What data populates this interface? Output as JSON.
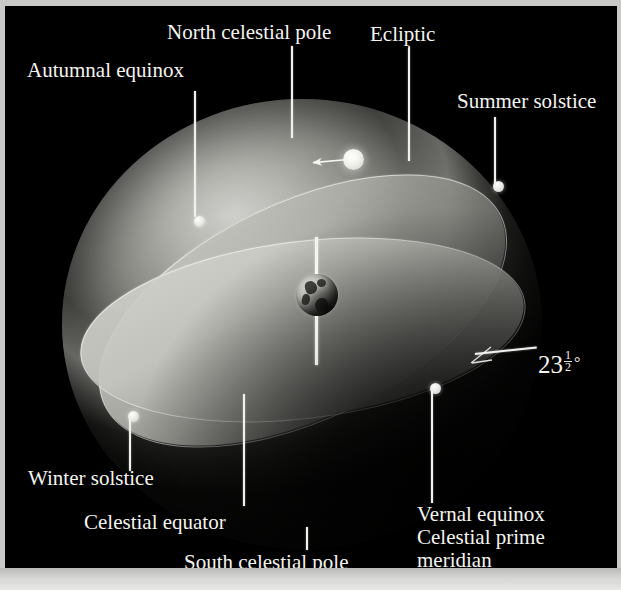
{
  "figure": {
    "background_color": "#000000",
    "frame_color": "#c9c9c7",
    "label_color": "#f4f4f0"
  },
  "labels": {
    "north_celestial_pole": "North celestial pole",
    "autumnal_equinox": "Autumnal equinox",
    "ecliptic": "Ecliptic",
    "summer_solstice": "Summer solstice",
    "winter_solstice": "Winter solstice",
    "celestial_equator": "Celestial equator",
    "south_celestial_pole": "South celestial pole",
    "vernal_equinox": "Vernal equinox",
    "celestial_prime_meridian_line1": "Celestial prime",
    "celestial_prime_meridian_line2": "meridian"
  },
  "angle": {
    "whole": "23",
    "numerator": "1",
    "denominator": "2",
    "degree_symbol": "°",
    "full_text": "23 1/2 degrees",
    "meaning": "obliquity of the ecliptic — tilt between celestial equator and ecliptic"
  },
  "objects": {
    "sun": "sun-disk",
    "earth": "earth-globe",
    "earth_axis": "rotation-axis",
    "sun_motion_arrow": "annual-apparent-motion-arrow"
  },
  "markers": [
    {
      "name": "autumnal-equinox-point",
      "x": 194,
      "y": 215
    },
    {
      "name": "summer-solstice-point",
      "x": 493,
      "y": 180
    },
    {
      "name": "vernal-equinox-point",
      "x": 430,
      "y": 382
    },
    {
      "name": "winter-solstice-point",
      "x": 128,
      "y": 410
    }
  ],
  "planes": [
    {
      "name": "celestial-equator-plane",
      "tilt_deg": -7
    },
    {
      "name": "ecliptic-plane",
      "tilt_deg": -25.5
    }
  ]
}
